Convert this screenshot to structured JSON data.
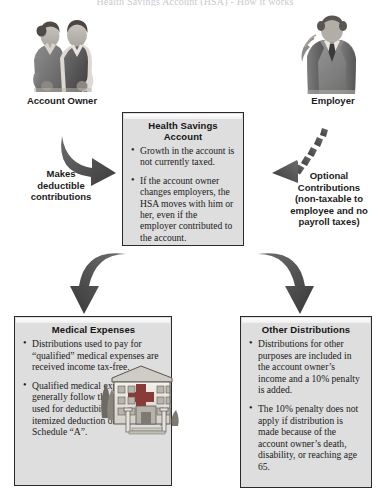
{
  "page": {
    "top_cut_text": "Health Savings Account (HSA) - How it works"
  },
  "actors": {
    "left": {
      "label": "Account Owner",
      "icon": "couple-illustration"
    },
    "right": {
      "label": "Employer",
      "icon": "businessman-illustration"
    }
  },
  "arrows": {
    "left_contribution": {
      "caption": "Makes\ndeductible\ncontributions",
      "icon": "curved-arrow-right-icon",
      "style": "solid"
    },
    "right_contribution": {
      "caption": "Optional\nContributions\n(non-taxable to\nemployee and no\npayroll taxes)",
      "icon": "curved-arrow-left-icon",
      "style": "dashed"
    },
    "to_medical": {
      "icon": "curved-arrow-down-left-icon"
    },
    "to_other": {
      "icon": "curved-arrow-down-right-icon"
    }
  },
  "boxes": {
    "hsa": {
      "title": "Health Savings Account",
      "bullets": [
        "Growth in the account is not currently taxed.",
        "If the account owner changes employers, the HSA moves with him or her, even if the employer contributed to the account."
      ]
    },
    "medical": {
      "title": "Medical Expenses",
      "bullets": [
        "Distributions used to pay for “qualified” medical expenses are received income tax-free.",
        "Qualified medical expenses generally follow the definition used for deductibility as an itemized deduction on form 1040, Schedule “A”."
      ],
      "illustration": "hospital-illustration"
    },
    "other": {
      "title": "Other Distributions",
      "bullets": [
        "Distributions for other purposes are included in the account owner’s income and a 10% penalty is added.",
        "The 10% penalty does not apply if distribution is made because of the account owner’s death, disability, or reaching age 65."
      ]
    }
  },
  "colors": {
    "box_fill": "#dedede",
    "box_border": "#2a2a2a",
    "arrow_fill": "#5a5a5a",
    "text": "#1a1a1a",
    "background": "#ffffff"
  }
}
